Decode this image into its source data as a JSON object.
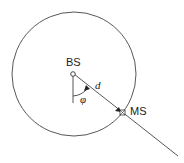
{
  "diagram": {
    "labels": {
      "base_station": "BS",
      "mobile_station": "MS",
      "distance": "d",
      "angle": "φ"
    },
    "colors": {
      "stroke": "#333333",
      "background": "#ffffff"
    }
  }
}
